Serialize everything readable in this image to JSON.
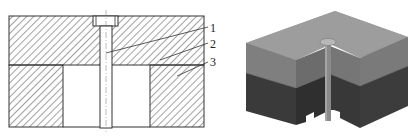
{
  "figure": {
    "left_view": {
      "type": "cross-section",
      "callouts": [
        {
          "number": "1",
          "label": "1"
        },
        {
          "number": "2",
          "label": "2"
        },
        {
          "number": "3",
          "label": "3"
        }
      ]
    },
    "right_view": {
      "type": "3d-render"
    },
    "colors": {
      "line": "#333333",
      "hatch": "#444444",
      "top_face": "#9a9a9a",
      "upper_side": "#7d7d7d",
      "upper_front": "#6e6e6e",
      "lower_side": "#3e3e3e",
      "lower_front": "#333333",
      "pin": "#8c8c8c"
    }
  }
}
